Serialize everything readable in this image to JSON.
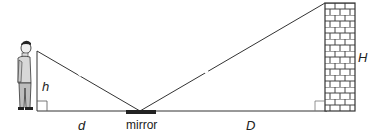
{
  "diagram": {
    "labels": {
      "person_height": "h",
      "person_distance": "d",
      "mirror": "mirror",
      "wall_distance": "D",
      "wall_height": "H"
    },
    "colors": {
      "line": "#333333",
      "brick_fill": "#ffffff",
      "brick_stroke": "#444444",
      "mirror": "#222222",
      "person_shirt": "#d8d8d8",
      "person_pants": "#bdbdbd"
    }
  }
}
